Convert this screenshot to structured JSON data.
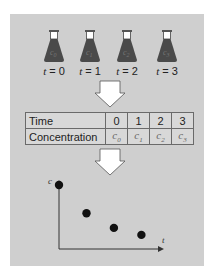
{
  "flasks": [
    {
      "symbol": "c0",
      "sub": "0",
      "time_label": "t = 0",
      "t": "t",
      "eq": " = 0"
    },
    {
      "symbol": "c1",
      "sub": "1",
      "time_label": "t = 1",
      "t": "t",
      "eq": " = 1"
    },
    {
      "symbol": "c2",
      "sub": "2",
      "time_label": "t = 2",
      "t": "t",
      "eq": " = 2"
    },
    {
      "symbol": "c3",
      "sub": "3",
      "time_label": "t = 3",
      "t": "t",
      "eq": " = 3"
    }
  ],
  "table": {
    "rows": [
      {
        "header": "Time",
        "cells": [
          "0",
          "1",
          "2",
          "3"
        ]
      },
      {
        "header": "Concentration",
        "cells": [
          "c0",
          "c1",
          "c2",
          "c3"
        ]
      }
    ]
  },
  "plot": {
    "y_axis_label": "c",
    "x_axis_label": "t"
  },
  "chart_data": {
    "type": "scatter",
    "title": "",
    "xlabel": "t",
    "ylabel": "c",
    "x": [
      0,
      1,
      2,
      3
    ],
    "y": [
      1.0,
      0.56,
      0.33,
      0.22
    ],
    "xlim": [
      0,
      3.9
    ],
    "ylim": [
      0,
      1.15
    ],
    "grid": false
  },
  "colors": {
    "panel": "#cfcfcf",
    "flask_body": "#4a4a4a",
    "flask_neck": "#ffffff",
    "arrow": "#ffffff",
    "dot": "#111111"
  }
}
